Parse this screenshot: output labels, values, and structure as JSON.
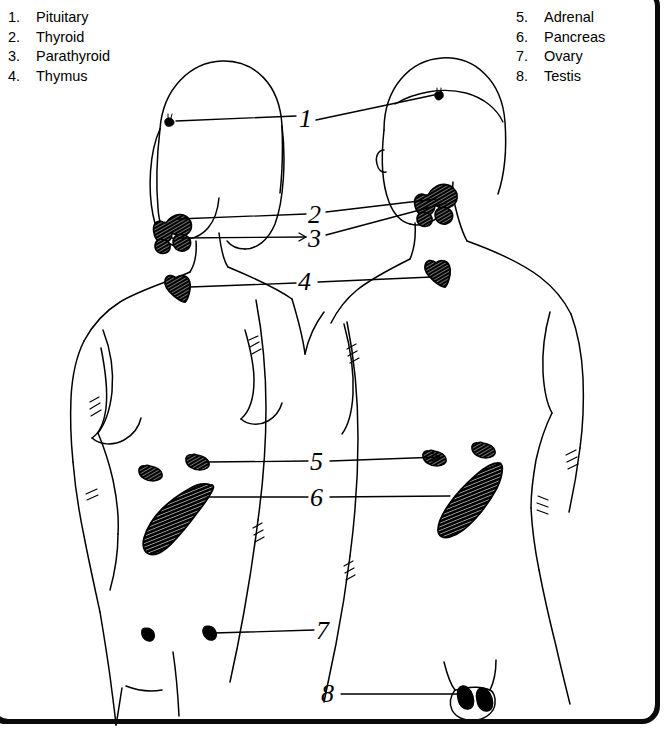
{
  "figure": {
    "style": "hand-drawn line art, black ink on white paper"
  },
  "legend_left": {
    "items": [
      {
        "number": "1.",
        "label": "Pituitary"
      },
      {
        "number": "2.",
        "label": "Thyroid"
      },
      {
        "number": "3.",
        "label": "Parathyroid"
      },
      {
        "number": "4.",
        "label": "Thymus"
      }
    ]
  },
  "legend_right": {
    "items": [
      {
        "number": "5.",
        "label": "Adrenal"
      },
      {
        "number": "6.",
        "label": "Pancreas"
      },
      {
        "number": "7.",
        "label": "Ovary"
      },
      {
        "number": "8.",
        "label": "Testis"
      }
    ]
  },
  "callouts": [
    {
      "number": "1",
      "gland": "Pituitary",
      "x": 306,
      "y": 120
    },
    {
      "number": "2",
      "gland": "Thyroid",
      "x": 316,
      "y": 215
    },
    {
      "number": "3",
      "gland": "Parathyroid",
      "x": 316,
      "y": 238
    },
    {
      "number": "4",
      "gland": "Thymus",
      "x": 306,
      "y": 281
    },
    {
      "number": "5",
      "gland": "Adrenal",
      "x": 318,
      "y": 461
    },
    {
      "number": "6",
      "gland": "Pancreas",
      "x": 318,
      "y": 497
    },
    {
      "number": "7",
      "gland": "Ovary",
      "x": 324,
      "y": 629
    },
    {
      "number": "8",
      "gland": "Testis",
      "x": 329,
      "y": 692
    }
  ],
  "colors": {
    "ink": "#000000",
    "paper": "#ffffff",
    "frame": "#0a0a0a"
  }
}
